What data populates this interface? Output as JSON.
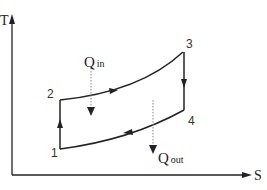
{
  "diagram": {
    "axes": {
      "y_label": "T",
      "x_label": "S"
    },
    "states": [
      {
        "id": "1",
        "label": "1"
      },
      {
        "id": "2",
        "label": "2"
      },
      {
        "id": "3",
        "label": "3"
      },
      {
        "id": "4",
        "label": "4"
      }
    ],
    "heat": {
      "in": {
        "main": "Q",
        "sub": "in"
      },
      "out": {
        "main": "Q",
        "sub": "out"
      }
    },
    "colors": {
      "line": "#222222",
      "dotted": "#888888",
      "background": "#ffffff"
    }
  }
}
